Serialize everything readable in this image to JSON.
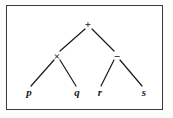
{
  "figure": {
    "kind": "expression-tree",
    "caption": "",
    "background_color": "#ffffff",
    "border_color": "#3a3a3a",
    "ink_color": "#1a1a1a"
  },
  "tree": {
    "expression": "(p x q) + (r - s)",
    "nodes": [
      {
        "id": "root",
        "label": "+",
        "type": "operator",
        "x": 88,
        "y": 24
      },
      {
        "id": "mul",
        "label": "×",
        "type": "operator",
        "x": 57,
        "y": 56
      },
      {
        "id": "minus",
        "label": "−",
        "type": "operator",
        "x": 117,
        "y": 56
      },
      {
        "id": "p",
        "label": "p",
        "type": "leaf",
        "x": 29,
        "y": 92
      },
      {
        "id": "q",
        "label": "q",
        "type": "leaf",
        "x": 77,
        "y": 92
      },
      {
        "id": "r",
        "label": "r",
        "type": "leaf",
        "x": 100,
        "y": 92
      },
      {
        "id": "s",
        "label": "s",
        "type": "leaf",
        "x": 144,
        "y": 92
      }
    ],
    "edges": [
      {
        "from": "root",
        "to": "mul",
        "x1": 85,
        "y1": 29,
        "x2": 60,
        "y2": 51
      },
      {
        "from": "root",
        "to": "minus",
        "x1": 92,
        "y1": 29,
        "x2": 114,
        "y2": 51
      },
      {
        "from": "mul",
        "to": "p",
        "x1": 54,
        "y1": 60,
        "x2": 31,
        "y2": 86
      },
      {
        "from": "mul",
        "to": "q",
        "x1": 60,
        "y1": 60,
        "x2": 76,
        "y2": 86
      },
      {
        "from": "minus",
        "to": "r",
        "x1": 114,
        "y1": 60,
        "x2": 101,
        "y2": 86
      },
      {
        "from": "minus",
        "to": "s",
        "x1": 120,
        "y1": 60,
        "x2": 142,
        "y2": 86
      }
    ]
  }
}
